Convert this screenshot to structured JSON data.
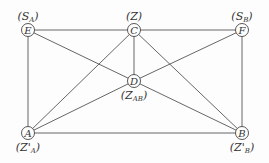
{
  "diagram": {
    "nodes": [
      {
        "id": "E",
        "label": "E",
        "annotation": "S",
        "sub": "A",
        "x": 28,
        "y": 30,
        "ann_pos": "above"
      },
      {
        "id": "C",
        "label": "C",
        "annotation": "Z",
        "sub": "",
        "x": 134,
        "y": 30,
        "ann_pos": "above"
      },
      {
        "id": "F",
        "label": "F",
        "annotation": "S",
        "sub": "B",
        "x": 242,
        "y": 30,
        "ann_pos": "above"
      },
      {
        "id": "D",
        "label": "D",
        "annotation": "Z",
        "sub": "AB",
        "x": 134,
        "y": 81,
        "ann_pos": "below"
      },
      {
        "id": "A",
        "label": "A",
        "annotation": "Z'",
        "sub": "A",
        "x": 28,
        "y": 133,
        "ann_pos": "below"
      },
      {
        "id": "B",
        "label": "B",
        "annotation": "Z'",
        "sub": "B",
        "x": 242,
        "y": 133,
        "ann_pos": "below"
      }
    ],
    "edges": [
      [
        "E",
        "C"
      ],
      [
        "C",
        "F"
      ],
      [
        "E",
        "A"
      ],
      [
        "F",
        "B"
      ],
      [
        "A",
        "B"
      ],
      [
        "E",
        "D"
      ],
      [
        "D",
        "B"
      ],
      [
        "F",
        "D"
      ],
      [
        "D",
        "A"
      ],
      [
        "C",
        "D"
      ],
      [
        "C",
        "A"
      ],
      [
        "C",
        "B"
      ]
    ]
  }
}
